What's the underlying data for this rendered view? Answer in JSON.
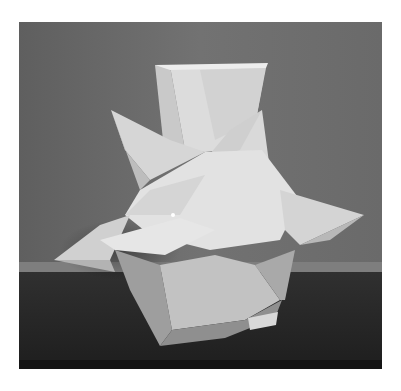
{
  "photo": {
    "subject": "white geometric faceted sculpture with spikes and a flared square opening",
    "colors": {
      "wall": "#6f6f6f",
      "wall_dark": "#5e5e5e",
      "shelf_edge": "#8a8a8a",
      "shelf": "#2a2a2a",
      "shelf_dark": "#1c1c1c",
      "facet_light": "#e8e8e8",
      "facet_mid": "#cfcfcf",
      "facet_shade": "#a9a9a9",
      "facet_dark": "#8c8c8c"
    }
  }
}
